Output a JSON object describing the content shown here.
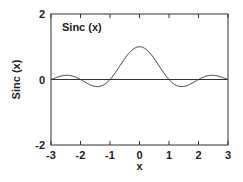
{
  "chart_data": {
    "type": "line",
    "title": "",
    "annotation": "Sinc (x)",
    "xlabel": "x",
    "ylabel": "Sinc (x)",
    "xlim": [
      -3,
      3
    ],
    "ylim": [
      -2,
      2
    ],
    "xticks": [
      "-3",
      "-2",
      "-1",
      "0",
      "1",
      "2",
      "3"
    ],
    "yticks": [
      "2",
      "0",
      "-2"
    ],
    "grid": false,
    "legend": "none",
    "series": [
      {
        "name": "Sinc (x)",
        "function": "sin(pi*x)/(pi*x)",
        "x": [
          -3,
          -2.5,
          -2,
          -1.5,
          -1,
          -0.5,
          0,
          0.5,
          1,
          1.5,
          2,
          2.5,
          3
        ],
        "values": [
          0,
          0.127,
          0,
          -0.212,
          0,
          0.637,
          1,
          0.637,
          0,
          -0.212,
          0,
          0.127,
          0
        ]
      },
      {
        "name": "zero line",
        "x": [
          -3,
          3
        ],
        "values": [
          0,
          0
        ]
      }
    ]
  }
}
